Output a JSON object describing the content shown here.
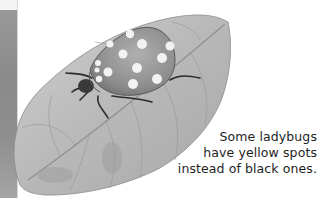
{
  "page": {
    "background": "#ffffff",
    "illustration": {
      "subject": "ladybug-on-leaf",
      "style": "grayscale pencil drawing",
      "ladybug_spot_color": "#f2f2f2",
      "leaf_color": "#b5b5b5"
    },
    "left_photo_strip": {
      "color": "#909090"
    },
    "caption": {
      "lines": [
        "Some ladybugs",
        "have yellow spots",
        "instead of black ones."
      ]
    }
  }
}
